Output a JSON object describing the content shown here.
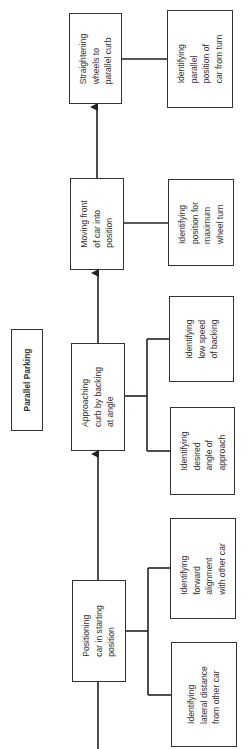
{
  "title": "Parallel Parking",
  "steps": [
    {
      "label": "Positioning\ncar in starting\nposition",
      "subtasks": [
        "Identifying\nforward\nalignment\nwith other car",
        "Identifying\nlateral distance\nfrom other car"
      ]
    },
    {
      "label": "Approaching\ncurb by backing\nat angle",
      "subtasks": [
        "Identifying\nlow speed\nof backing",
        "Identifying\ndesired\nangle of\napproach"
      ]
    },
    {
      "label": "Moving front\nof car into\nposition",
      "subtasks": [
        "Identifying\nposition for\nmaximum\nwheel turn"
      ]
    },
    {
      "label": "Straightening\nwheels to\nparallel curb",
      "subtasks": [
        "Identifying\nparallel\nposition of\ncar from turn"
      ]
    }
  ],
  "colors": {
    "line": "#222222",
    "border": "#333333",
    "background": "#ffffff"
  }
}
